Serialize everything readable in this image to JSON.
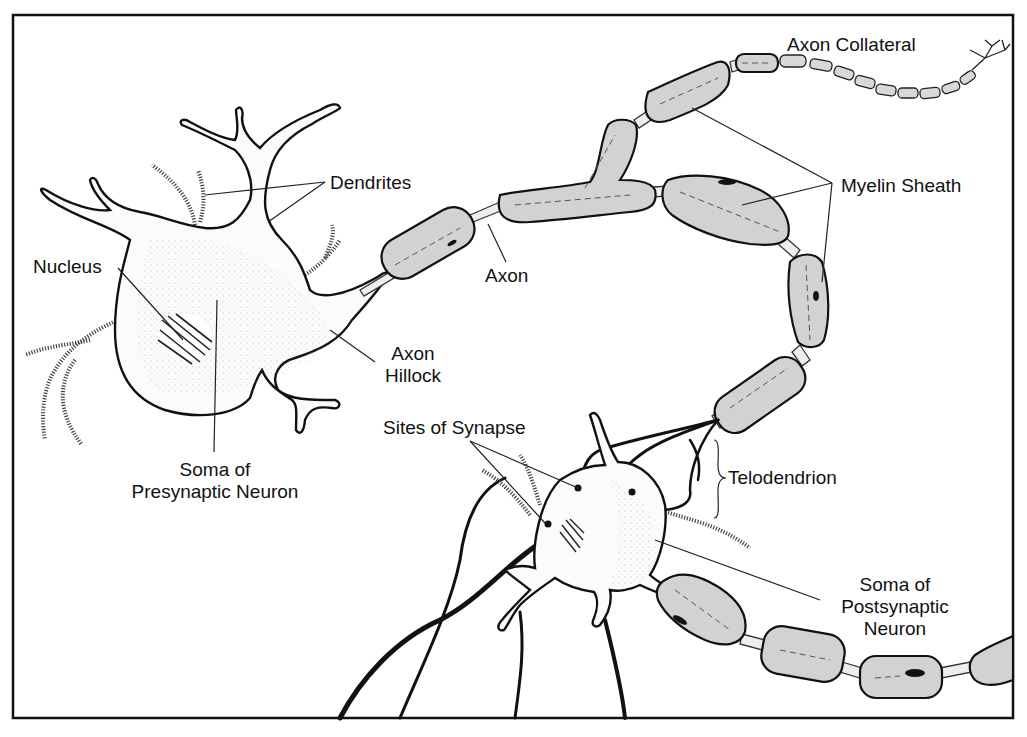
{
  "diagram": {
    "colors": {
      "background": "#ffffff",
      "line": "#111111",
      "myelin_fill": "#d2d2d2",
      "text": "#111111"
    },
    "labels": {
      "axon_collateral": "Axon Collateral",
      "dendrites": "Dendrites",
      "myelin_sheath": "Myelin Sheath",
      "nucleus": "Nucleus",
      "axon": "Axon",
      "axon_hillock_line1": "Axon",
      "axon_hillock_line2": "Hillock",
      "soma_pre_line1": "Soma of",
      "soma_pre_line2": "Presynaptic Neuron",
      "sites_of_synapse": "Sites of Synapse",
      "telodendrion": "Telodendrion",
      "soma_post_line1": "Soma of",
      "soma_post_line2": "Postsynaptic",
      "soma_post_line3": "Neuron"
    }
  }
}
